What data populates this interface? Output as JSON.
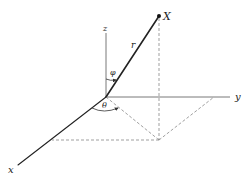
{
  "figure": {
    "labels": {
      "point": "X",
      "radius": "r",
      "polar_angle": "φ",
      "azimuth_angle": "θ",
      "x_axis": "x",
      "y_axis": "y",
      "z_axis": "z"
    },
    "colors": {
      "ink": "#222222",
      "axis": "#555555",
      "dashed": "#777777"
    }
  }
}
